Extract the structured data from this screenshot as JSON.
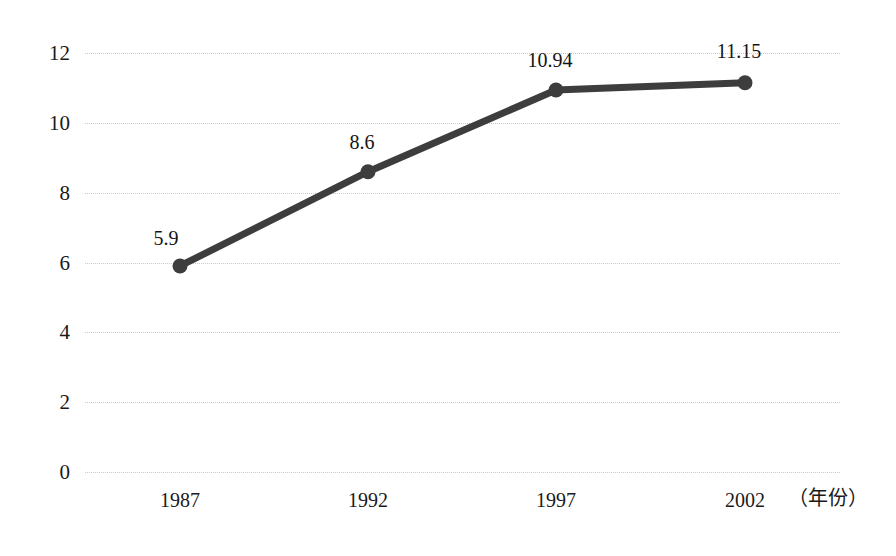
{
  "chart_data": {
    "type": "line",
    "title": "",
    "subtitle": "",
    "xlabel": "（年份）",
    "ylabel": "",
    "categories": [
      "1987",
      "1992",
      "1997",
      "2002"
    ],
    "x": [
      1987,
      1992,
      1997,
      2002
    ],
    "values": [
      5.9,
      8.6,
      10.94,
      11.15
    ],
    "point_labels": [
      "5.9",
      "8.6",
      "10.94",
      "11.15"
    ],
    "series": [
      {
        "name": "",
        "values": [
          5.9,
          8.6,
          10.94,
          11.15
        ],
        "color": "#3d3d3d",
        "marker": "circle"
      }
    ],
    "ylim": [
      0,
      12
    ],
    "ytick_values": [
      0,
      2,
      4,
      6,
      8,
      10,
      12
    ],
    "ytick_labels": [
      "0",
      "2",
      "4",
      "6",
      "8",
      "10",
      "12"
    ],
    "xtick_labels": [
      "1987",
      "1992",
      "1997",
      "2002"
    ],
    "grid": true,
    "grid_axis": "y",
    "grid_style": "dotted",
    "grid_color": "#c9c9c9",
    "legend": false,
    "legend_position": "none",
    "background": "#ffffff",
    "annotations": []
  },
  "axis": {
    "unit_label": "（年份）"
  },
  "colors": {
    "line": "#3d3d3d",
    "marker": "#3d3d3d",
    "grid": "#c9c9c9",
    "text": "#1a1a1a",
    "background": "#ffffff"
  }
}
